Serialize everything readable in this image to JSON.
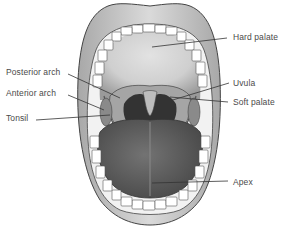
{
  "diagram": {
    "colors": {
      "lip": "#c9c9c9",
      "lip_edge": "#555555",
      "tooth": "#ffffff",
      "palate": "#d4d4d4",
      "throat": "#3a3a3a",
      "tongue": "#5e5e5e",
      "leader_line": "#333333",
      "label_text": "#4a4a4a"
    },
    "labels": {
      "hard_palate": "Hard palate",
      "posterior_arch": "Posterior arch",
      "uvula": "Uvula",
      "anterior_arch": "Anterior arch",
      "soft_palate": "Soft palate",
      "tonsil": "Tonsil",
      "apex": "Apex"
    }
  }
}
